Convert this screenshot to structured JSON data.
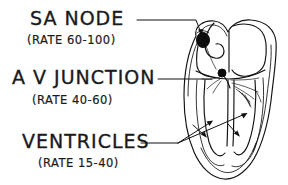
{
  "diagram": {
    "background_color": "#ffffff",
    "ink_color": "#111111",
    "labels": [
      {
        "id": "sa-node",
        "main": "SA NODE",
        "sub": "(RATE 60-100)",
        "rate_low": 60,
        "rate_high": 100,
        "rate_units": "beats per minute"
      },
      {
        "id": "av-junction",
        "main": "A V JUNCTION",
        "sub": "(RATE 40-60)",
        "rate_low": 40,
        "rate_high": 60,
        "rate_units": "beats per minute"
      },
      {
        "id": "ventricles",
        "main": "VENTRICLES",
        "sub": "(RATE 15-40)",
        "rate_low": 15,
        "rate_high": 40,
        "rate_units": "beats per minute"
      }
    ],
    "heart": {
      "sa_node_marker": "filled-oval",
      "av_node_marker": "filled-node",
      "conduction_fibers": "purkinje-branches",
      "chambers": [
        "right atrium",
        "left atrium",
        "right ventricle",
        "left ventricle"
      ]
    }
  }
}
